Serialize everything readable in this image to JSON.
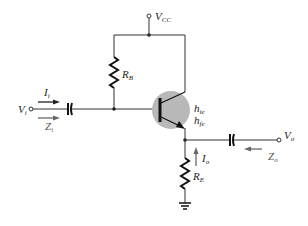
{
  "diagram": {
    "type": "common-collector emitter-follower circuit",
    "colors": {
      "wire": "#333333",
      "transistor_halo": "#b8b8b8",
      "arrow_dark": "#222222",
      "arrow_grey": "#666666"
    },
    "labels": {
      "vcc": {
        "main": "V",
        "sub": "CC"
      },
      "rb": {
        "main": "R",
        "sub": "B"
      },
      "re": {
        "main": "R",
        "sub": "E"
      },
      "vi": {
        "main": "V",
        "sub": "i"
      },
      "ii": {
        "main": "I",
        "sub": "i"
      },
      "zi": {
        "main": "Z",
        "sub": "i"
      },
      "vo": {
        "main": "V",
        "sub": "o"
      },
      "zo": {
        "main": "Z",
        "sub": "o"
      },
      "io": {
        "main": "I",
        "sub": "o"
      },
      "hie": {
        "main": "h",
        "sub": "ie"
      },
      "hfe": {
        "main": "h",
        "sub": "fe"
      }
    }
  }
}
